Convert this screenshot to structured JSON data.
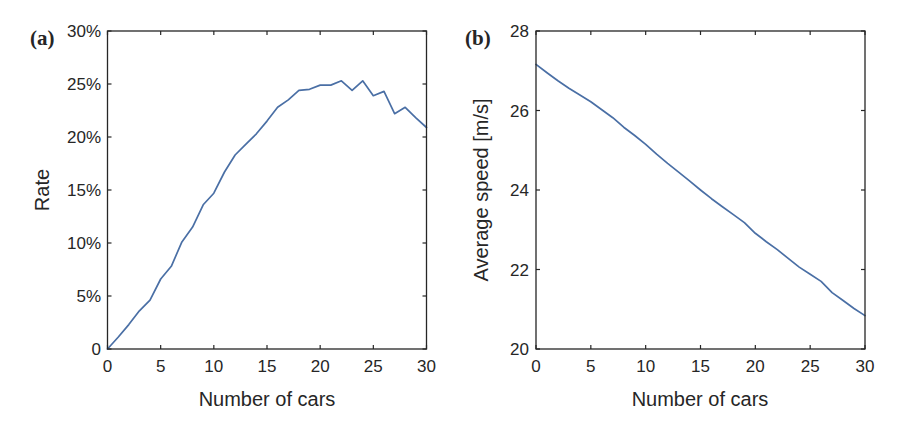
{
  "chart_data": [
    {
      "panel": "(a)",
      "type": "line",
      "title": "",
      "xlabel": "Number of cars",
      "ylabel": "Rate",
      "xlim": [
        0,
        30
      ],
      "ylim": [
        0,
        30
      ],
      "x_ticks": [
        0,
        5,
        10,
        15,
        20,
        25,
        30
      ],
      "y_ticks": [
        0,
        5,
        10,
        15,
        20,
        25,
        30
      ],
      "y_tick_labels": [
        "0",
        "5%",
        "10%",
        "15%",
        "20%",
        "25%",
        "30%"
      ],
      "x_tick_labels": [
        "0",
        "5",
        "10",
        "15",
        "20",
        "25",
        "30"
      ],
      "grid": false,
      "legend": null,
      "series": [
        {
          "name": "Rate",
          "color": "#4a6fa5",
          "x": [
            0,
            1,
            2,
            3,
            4,
            5,
            6,
            7,
            8,
            9,
            10,
            11,
            12,
            13,
            14,
            15,
            16,
            17,
            18,
            19,
            20,
            21,
            22,
            23,
            24,
            25,
            26,
            27,
            28,
            29,
            30
          ],
          "values": [
            0,
            1.1,
            2.3,
            3.6,
            4.6,
            6.6,
            7.8,
            10.1,
            11.5,
            13.6,
            14.7,
            16.7,
            18.3,
            19.3,
            20.3,
            21.5,
            22.8,
            23.5,
            24.4,
            24.5,
            24.9,
            24.9,
            25.3,
            24.4,
            25.3,
            23.9,
            24.3,
            22.2,
            22.8,
            21.8,
            20.9
          ]
        }
      ]
    },
    {
      "panel": "(b)",
      "type": "line",
      "title": "",
      "xlabel": "Number of cars",
      "ylabel": "Average speed [m/s]",
      "xlim": [
        0,
        30
      ],
      "ylim": [
        20,
        28
      ],
      "x_ticks": [
        0,
        5,
        10,
        15,
        20,
        25,
        30
      ],
      "y_ticks": [
        20,
        22,
        24,
        26,
        28
      ],
      "y_tick_labels": [
        "20",
        "22",
        "24",
        "26",
        "28"
      ],
      "x_tick_labels": [
        "0",
        "5",
        "10",
        "15",
        "20",
        "25",
        "30"
      ],
      "grid": false,
      "legend": null,
      "series": [
        {
          "name": "Average speed",
          "color": "#4a6fa5",
          "x": [
            0,
            1,
            2,
            3,
            4,
            5,
            6,
            7,
            8,
            9,
            10,
            11,
            12,
            13,
            14,
            15,
            16,
            17,
            18,
            19,
            20,
            21,
            22,
            23,
            24,
            25,
            26,
            27,
            28,
            29,
            30
          ],
          "values": [
            27.16,
            26.95,
            26.75,
            26.56,
            26.39,
            26.22,
            26.02,
            25.82,
            25.58,
            25.37,
            25.15,
            24.9,
            24.67,
            24.45,
            24.23,
            24.0,
            23.78,
            23.58,
            23.38,
            23.18,
            22.91,
            22.7,
            22.5,
            22.28,
            22.06,
            21.88,
            21.7,
            21.42,
            21.22,
            21.02,
            20.84
          ]
        }
      ]
    }
  ],
  "panels": {
    "a": {
      "label": "(a)",
      "xlabel": "Number of cars",
      "ylabel": "Rate"
    },
    "b": {
      "label": "(b)",
      "xlabel": "Number of cars",
      "ylabel": "Average speed [m/s]"
    }
  }
}
